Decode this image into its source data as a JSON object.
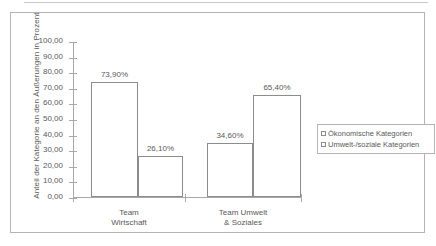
{
  "chart_data": {
    "type": "bar",
    "title": "",
    "xlabel": "",
    "ylabel": "Anteil der Kategorie an den Äußerungen in Prozent",
    "ylim": [
      0,
      100
    ],
    "ytick_step": 10,
    "grid": false,
    "legend_position": "right",
    "categories": [
      "Team Wirtschaft",
      "Team Umwelt & Soziales"
    ],
    "category_lines": [
      [
        "Team",
        "Wirtschaft"
      ],
      [
        "Team Umwelt",
        "& Soziales"
      ]
    ],
    "ytick_labels": [
      "0,00",
      "10,00",
      "20,00",
      "30,00",
      "40,00",
      "50,00",
      "60,00",
      "70,00",
      "80,00",
      "90,00",
      "100,00"
    ],
    "series": [
      {
        "name": "Ökonomische Kategorien",
        "values": [
          73.9,
          26.1
        ],
        "labels": [
          "73,90%",
          "34,60%"
        ]
      },
      {
        "name": "Umwelt-/soziale Kategorien",
        "values": [
          34.6,
          65.4
        ],
        "labels": [
          "26,10%",
          "65,40%"
        ]
      }
    ],
    "bars": [
      {
        "label": "73,90%",
        "value": 73.9,
        "group": "Team Wirtschaft"
      },
      {
        "label": "26,10%",
        "value": 26.1,
        "group": "Team Wirtschaft"
      },
      {
        "label": "34,60%",
        "value": 34.6,
        "group": "Team Umwelt & Soziales"
      },
      {
        "label": "65,40%",
        "value": 65.4,
        "group": "Team Umwelt & Soziales"
      }
    ],
    "colors": {
      "bar_border": "#8c8c8c",
      "bar_fill": "#ffffff",
      "axis": "#a8a8a8",
      "text": "#595959",
      "frame": "#b4b4b4"
    }
  },
  "legend": {
    "items": [
      {
        "label": "Ökonomische Kategorien"
      },
      {
        "label": "Umwelt-/soziale Kategorien"
      }
    ]
  }
}
